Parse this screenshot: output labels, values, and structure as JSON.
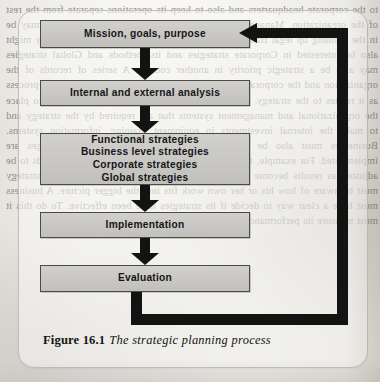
{
  "figure": {
    "caption_label": "Figure 16.1",
    "caption_text": "The strategic planning process",
    "colors": {
      "box_fill": "#c9c7c3",
      "box_border": "#4a4a48",
      "arrow": "#131313",
      "frame_border": "#c2bfba",
      "page_background": "#eceae6",
      "text": "#16161a"
    }
  },
  "flow": {
    "boxes": [
      {
        "id": "mission",
        "label": "Mission, goals, purpose"
      },
      {
        "id": "analysis",
        "label": "Internal and external analysis"
      },
      {
        "id": "strategies",
        "label": "Functional strategies\nBusiness level strategies\nCorporate strategies\nGlobal strategies"
      },
      {
        "id": "implement",
        "label": "Implementation"
      },
      {
        "id": "evaluation",
        "label": "Evaluation"
      }
    ],
    "connectors": [
      {
        "id": "arrow-1",
        "from": "mission",
        "to": "analysis",
        "direction": "down"
      },
      {
        "id": "arrow-2",
        "from": "analysis",
        "to": "strategies",
        "direction": "down"
      },
      {
        "id": "arrow-3",
        "from": "strategies",
        "to": "implement",
        "direction": "down"
      },
      {
        "id": "arrow-4",
        "from": "implement",
        "to": "evaluation",
        "direction": "down"
      }
    ],
    "feedback_loop": {
      "from": "evaluation",
      "to": "mission",
      "direction": "left",
      "path": "down-right-up-left"
    }
  },
  "page_background_text": "to the corporate headquarters and also to keep its operations separate from the rest of the organization. Management techniques such as Corporate strategies may be in the building up legal frameworks and resource co-ordination. A company might also be interested in Corporate strategies and its methods and Global strategies may also be a strategic priority in another country. A series of records of the organization and the corporate strategy is needed and also for the planning process as it relates to the strategy. It is important that a business needs to put into place the organizational and management systems that are required by the strategy and to make the internal investments in equipment, training, information systems. Businesses must also be able to interpret the way in which changes are implemented. For example, they may need to recognize that a strategy needs to be adjusted as results become clear. Everyone involved in implementing a strategy must be aware of how his or her own work fits into the bigger picture. A business must have a clear way to decide if its strategies have been effective. To do this it must measure its performance against the objectives it has set."
}
